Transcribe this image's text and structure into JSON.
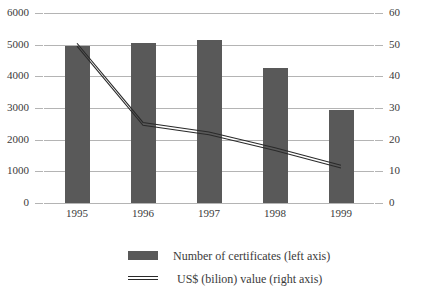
{
  "chart_data": {
    "type": "bar",
    "title": "",
    "subtitle": "",
    "xlabel": "",
    "ylabel": "",
    "grid": true,
    "legend_position": "bottom",
    "categories": [
      "1995",
      "1996",
      "1997",
      "1998",
      "1999"
    ],
    "left_axis": {
      "label": "Number of certificates",
      "ticks": [
        "0",
        "1000",
        "2000",
        "3000",
        "4000",
        "5000",
        "6000"
      ],
      "tick_values": [
        0,
        1000,
        2000,
        3000,
        4000,
        5000,
        6000
      ],
      "ylim": [
        0,
        6000
      ]
    },
    "right_axis": {
      "label": "US$ (bilion) value",
      "ticks": [
        "0",
        "10",
        "20",
        "30",
        "40",
        "50",
        "60"
      ],
      "tick_values": [
        0,
        10,
        20,
        30,
        40,
        50,
        60
      ],
      "ylim": [
        0,
        60
      ]
    },
    "series": [
      {
        "name": "Number of certificates (left axis)",
        "kind": "bar",
        "axis": "left",
        "color": "#595959",
        "values": [
          4950,
          5050,
          5150,
          4250,
          2950
        ]
      },
      {
        "name": "US$ (bilion) value (right axis)",
        "kind": "line",
        "axis": "right",
        "color": "#2a2a2a",
        "values": [
          50,
          25,
          22,
          17,
          11.5
        ]
      }
    ]
  },
  "legend": {
    "items": [
      {
        "label": "Number of certificates (left axis)",
        "marker": "bar-swatch"
      },
      {
        "label": "US$ (bilion) value (right axis)",
        "marker": "line-swatch"
      }
    ]
  }
}
